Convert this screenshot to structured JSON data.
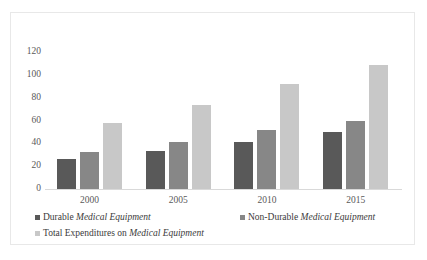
{
  "chart_data": {
    "type": "bar",
    "title": "",
    "subtitle": "",
    "xlabel": "",
    "ylabel": "",
    "categories": [
      "2000",
      "2005",
      "2010",
      "2015"
    ],
    "series": [
      {
        "name": "Durable Medical Equipment",
        "name_plain": "Durable ",
        "name_italic": "Medical Equipment",
        "color": "#595959",
        "values": [
          26,
          33,
          41,
          50
        ]
      },
      {
        "name": "Non-Durable Medical Equipment",
        "name_plain": "Non-Durable ",
        "name_italic": "Medical Equipment",
        "color": "#878787",
        "values": [
          32,
          41,
          52,
          60
        ]
      },
      {
        "name": "Total Expenditures on Medical Equipment",
        "name_plain": "Total Expenditures on ",
        "name_italic": "Medical Equipment",
        "color": "#c8c8c8",
        "values": [
          58,
          74,
          92,
          109
        ]
      }
    ],
    "yticks": [
      120,
      100,
      80,
      60,
      40,
      20,
      0
    ],
    "ylim": [
      0,
      120
    ],
    "grid": false,
    "legend_position": "bottom"
  },
  "axes": {
    "y_tick_labels": [
      "120",
      "100",
      "80",
      "60",
      "40",
      "20",
      "0"
    ],
    "x_tick_labels": [
      "2000",
      "2005",
      "2010",
      "2015"
    ]
  },
  "legend": {
    "items": [
      {
        "plain": "Durable ",
        "italic": "Medical Equipment"
      },
      {
        "plain": "Non-Durable ",
        "italic": "Medical Equipment"
      },
      {
        "plain": "Total Expenditures on ",
        "italic": "Medical Equipment"
      }
    ]
  },
  "colors": {
    "series_1": "#595959",
    "series_2": "#878787",
    "series_3": "#c8c8c8",
    "axis": "#d9d9d9",
    "text": "#595959",
    "frame": "#e8e8e8",
    "background": "#ffffff"
  }
}
